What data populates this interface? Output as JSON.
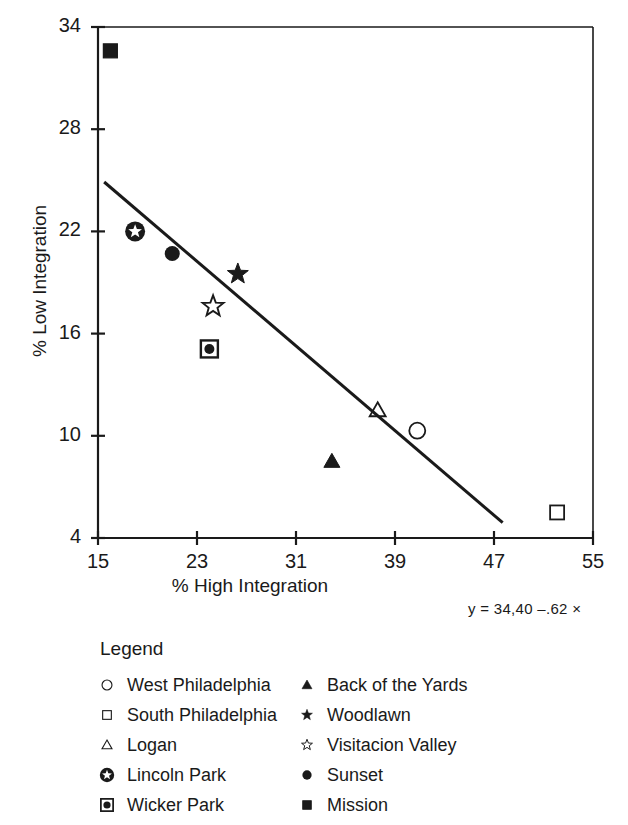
{
  "chart_data": {
    "type": "scatter",
    "title": "",
    "xlabel": "% High Integration",
    "ylabel": "% Low Integration",
    "xlim": [
      15,
      55
    ],
    "ylim": [
      4,
      34
    ],
    "xticks": [
      15,
      23,
      31,
      39,
      47,
      55
    ],
    "yticks": [
      4,
      10,
      16,
      22,
      28,
      34
    ],
    "grid": false,
    "legend_position": "below-plot",
    "legend_title": "Legend",
    "annotation": "y = 34,40 –.62 ×",
    "points": [
      {
        "label": "Mission",
        "marker": "filled-square",
        "x": 16.0,
        "y": 32.6
      },
      {
        "label": "Lincoln Park",
        "marker": "circled-star",
        "x": 18.0,
        "y": 22.0
      },
      {
        "label": "Sunset",
        "marker": "filled-circle",
        "x": 21.0,
        "y": 20.7
      },
      {
        "label": "Woodlawn",
        "marker": "filled-star",
        "x": 26.3,
        "y": 19.5
      },
      {
        "label": "Visitacion Valley",
        "marker": "open-star",
        "x": 24.3,
        "y": 17.6
      },
      {
        "label": "Wicker Park",
        "marker": "squared-circle",
        "x": 24.0,
        "y": 15.1
      },
      {
        "label": "Logan",
        "marker": "open-triangle",
        "x": 37.6,
        "y": 11.5
      },
      {
        "label": "West Philadelphia",
        "marker": "open-circle",
        "x": 40.8,
        "y": 10.3
      },
      {
        "label": "Back of the Yards",
        "marker": "filled-triangle",
        "x": 33.9,
        "y": 8.5
      },
      {
        "label": "South Philadelphia",
        "marker": "open-square",
        "x": 52.1,
        "y": 5.5
      }
    ],
    "fit_line": {
      "x0": 15.5,
      "y0": 24.9,
      "x1": 47.7,
      "y1": 4.9,
      "intercept": 34.4,
      "slope": -0.62
    }
  },
  "legend": {
    "title": "Legend",
    "column_left": [
      {
        "label": "West Philadelphia",
        "marker": "open-circle"
      },
      {
        "label": "South Philadelphia",
        "marker": "open-square"
      },
      {
        "label": "Logan",
        "marker": "open-triangle"
      },
      {
        "label": "Lincoln Park",
        "marker": "circled-star"
      },
      {
        "label": "Wicker Park",
        "marker": "squared-circle"
      }
    ],
    "column_right": [
      {
        "label": "Back of the Yards",
        "marker": "filled-triangle"
      },
      {
        "label": "Woodlawn",
        "marker": "filled-star"
      },
      {
        "label": "Visitacion Valley",
        "marker": "open-star"
      },
      {
        "label": "Sunset",
        "marker": "filled-circle"
      },
      {
        "label": "Mission",
        "marker": "filled-square"
      }
    ]
  },
  "colors": {
    "ink": "#1a1a1a",
    "axis": "#262626",
    "background": "#ffffff"
  }
}
